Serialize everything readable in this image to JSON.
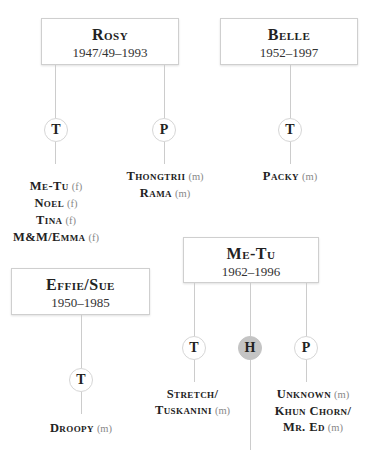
{
  "mothers": [
    {
      "id": "rosy",
      "name": "Rosy",
      "years": "1947/49–1993",
      "groups": [
        {
          "type": "T",
          "filled": false,
          "children": [
            {
              "name": "Me-Tu",
              "sex": "(f)"
            },
            {
              "name": "Noel",
              "sex": "(f)"
            },
            {
              "name": "Tina",
              "sex": "(f)"
            },
            {
              "name": "M&M/Emma",
              "sex": "(f)"
            }
          ]
        },
        {
          "type": "P",
          "filled": false,
          "children": [
            {
              "name": "Thongtrii",
              "sex": "(m)"
            },
            {
              "name": "Rama",
              "sex": "(m)"
            }
          ]
        }
      ]
    },
    {
      "id": "belle",
      "name": "Belle",
      "years": "1952–1997",
      "groups": [
        {
          "type": "T",
          "filled": false,
          "children": [
            {
              "name": "Packy",
              "sex": "(m)"
            }
          ]
        }
      ]
    },
    {
      "id": "metu",
      "name": "Me-Tu",
      "years": "1962–1996",
      "groups": [
        {
          "type": "T",
          "filled": false,
          "children": [
            {
              "name": "Stretch/",
              "sex": ""
            },
            {
              "name": "Tuskanini",
              "sex": "(m)"
            }
          ]
        },
        {
          "type": "H",
          "filled": true,
          "children": []
        },
        {
          "type": "P",
          "filled": false,
          "children": [
            {
              "name": "Unknown",
              "sex": "(m)"
            },
            {
              "name": "Khun Chorn/",
              "sex": ""
            },
            {
              "name": "Mr. Ed",
              "sex": "(m)"
            }
          ]
        }
      ]
    },
    {
      "id": "effie",
      "name": "Effie/Sue",
      "years": "1950–1985",
      "groups": [
        {
          "type": "T",
          "filled": false,
          "children": [
            {
              "name": "Droopy",
              "sex": "(m)"
            }
          ]
        }
      ]
    }
  ],
  "colors": {
    "line": "#cccccc",
    "box_border": "#cfcfcf",
    "filled_circle": "#c4c4c4",
    "text": "#222222",
    "sex_label": "#888888"
  }
}
